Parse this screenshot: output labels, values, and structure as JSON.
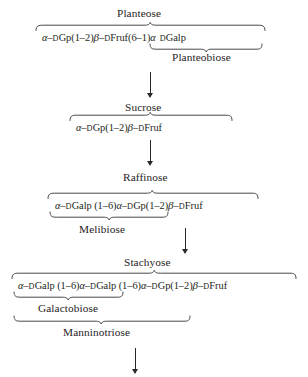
{
  "figure": {
    "background_color": "#ffffff",
    "ink_color": "#231f20"
  },
  "nodes": [
    {
      "id": "planteose",
      "label": "Planteose"
    },
    {
      "id": "planteobiose",
      "label": "Planteobiose"
    },
    {
      "id": "sucrose",
      "label": "Sucrose"
    },
    {
      "id": "raffinose",
      "label": "Raffinose"
    },
    {
      "id": "melibiose",
      "label": "Melibiose"
    },
    {
      "id": "stachyose",
      "label": "Stachyose"
    },
    {
      "id": "galactobiose",
      "label": "Galactobiose"
    },
    {
      "id": "manninotriose",
      "label": "Manninotriose"
    }
  ],
  "formulas": {
    "planteose": {
      "plain": "α–DGp(1–2)β–DFruf(6–1)α DGalp",
      "segments": [
        {
          "t": "α",
          "k": "gk"
        },
        {
          "t": "–",
          "k": "dash"
        },
        {
          "t": "D",
          "k": "sc"
        },
        {
          "t": "Gp(1",
          "k": "n"
        },
        {
          "t": "–",
          "k": "dash"
        },
        {
          "t": "2)",
          "k": "n"
        },
        {
          "t": "β",
          "k": "beta"
        },
        {
          "t": "–",
          "k": "dash"
        },
        {
          "t": "D",
          "k": "sc"
        },
        {
          "t": "Fruf(6",
          "k": "n"
        },
        {
          "t": "–",
          "k": "dash"
        },
        {
          "t": "1)",
          "k": "n"
        },
        {
          "t": "α",
          "k": "gk"
        },
        {
          "t": " ",
          "k": "spw"
        },
        {
          "t": "D",
          "k": "sc"
        },
        {
          "t": "Galp",
          "k": "n"
        }
      ]
    },
    "sucrose": {
      "plain": "α–DGp(1–2)β–DFruf",
      "segments": [
        {
          "t": "α",
          "k": "gk"
        },
        {
          "t": "–",
          "k": "dash"
        },
        {
          "t": "D",
          "k": "sc"
        },
        {
          "t": "Gp(1",
          "k": "n"
        },
        {
          "t": "–",
          "k": "dash"
        },
        {
          "t": "2)",
          "k": "n"
        },
        {
          "t": "β",
          "k": "beta"
        },
        {
          "t": "–",
          "k": "dash"
        },
        {
          "t": "D",
          "k": "sc"
        },
        {
          "t": "Fruf",
          "k": "n"
        }
      ]
    },
    "raffinose": {
      "plain": "α–DGalp (1–6)α–DGp(1–2)β–DFruf",
      "segments": [
        {
          "t": "α",
          "k": "gk"
        },
        {
          "t": "–",
          "k": "dash"
        },
        {
          "t": "D",
          "k": "sc"
        },
        {
          "t": "Galp (1",
          "k": "n"
        },
        {
          "t": "–",
          "k": "dash"
        },
        {
          "t": "6)",
          "k": "n"
        },
        {
          "t": "α",
          "k": "gk"
        },
        {
          "t": "–",
          "k": "dash"
        },
        {
          "t": "D",
          "k": "sc"
        },
        {
          "t": "Gp(1",
          "k": "n"
        },
        {
          "t": "–",
          "k": "dash"
        },
        {
          "t": "2)",
          "k": "n"
        },
        {
          "t": "β",
          "k": "beta"
        },
        {
          "t": "–",
          "k": "dash"
        },
        {
          "t": "D",
          "k": "sc"
        },
        {
          "t": "Fruf",
          "k": "n"
        }
      ]
    },
    "stachyose": {
      "plain": "α–DGalp (1–6)α–DGalp (1–6)α–DGp(1–2)β–DFruf",
      "segments": [
        {
          "t": "α",
          "k": "gk"
        },
        {
          "t": "–",
          "k": "dash"
        },
        {
          "t": "D",
          "k": "sc"
        },
        {
          "t": "Galp (1",
          "k": "n"
        },
        {
          "t": "–",
          "k": "dash"
        },
        {
          "t": "6)",
          "k": "n"
        },
        {
          "t": "α",
          "k": "gk"
        },
        {
          "t": "–",
          "k": "dash"
        },
        {
          "t": "D",
          "k": "sc"
        },
        {
          "t": "Galp (1",
          "k": "n"
        },
        {
          "t": "–",
          "k": "dash"
        },
        {
          "t": "6)",
          "k": "n"
        },
        {
          "t": "α",
          "k": "gk"
        },
        {
          "t": "–",
          "k": "dash"
        },
        {
          "t": "D",
          "k": "sc"
        },
        {
          "t": "Gp(1",
          "k": "n"
        },
        {
          "t": "–",
          "k": "dash"
        },
        {
          "t": "2)",
          "k": "n"
        },
        {
          "t": "β",
          "k": "beta"
        },
        {
          "t": "–",
          "k": "dash"
        },
        {
          "t": "D",
          "k": "sc"
        },
        {
          "t": "Fruf",
          "k": "n"
        }
      ]
    }
  },
  "arrows": [
    {
      "id": "planteose-to-sucrose",
      "direction": "down"
    },
    {
      "id": "sucrose-to-raffinose",
      "direction": "down"
    },
    {
      "id": "raffinose-to-stachyose",
      "direction": "down"
    },
    {
      "id": "stachyose-to-next",
      "direction": "down"
    }
  ],
  "braces": [
    {
      "id": "brace-planteose-top",
      "label_node": "planteose",
      "side": "above"
    },
    {
      "id": "brace-planteobiose",
      "label_node": "planteobiose",
      "side": "below"
    },
    {
      "id": "brace-sucrose-top",
      "label_node": "sucrose",
      "side": "above"
    },
    {
      "id": "brace-raffinose-top",
      "label_node": "raffinose",
      "side": "above"
    },
    {
      "id": "brace-melibiose",
      "label_node": "melibiose",
      "side": "below"
    },
    {
      "id": "brace-stachyose-top",
      "label_node": "stachyose",
      "side": "above"
    },
    {
      "id": "brace-galactobiose",
      "label_node": "galactobiose",
      "side": "below"
    },
    {
      "id": "brace-manninotriose",
      "label_node": "manninotriose",
      "side": "below"
    }
  ]
}
